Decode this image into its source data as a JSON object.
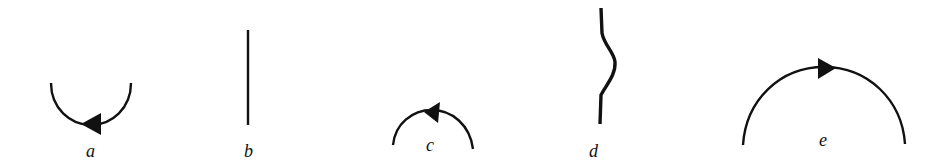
{
  "diagram": {
    "background": "#ffffff",
    "ink": "#111111",
    "items": [
      {
        "id": "a",
        "label": "a",
        "shape": "downward semicircle arc with arrow pointing left at bottom"
      },
      {
        "id": "b",
        "label": "b",
        "shape": "straight vertical line"
      },
      {
        "id": "c",
        "label": "c",
        "shape": "small upward arc with arrow pointing left at top"
      },
      {
        "id": "d",
        "label": "d",
        "shape": "wavy vertical line"
      },
      {
        "id": "e",
        "label": "e",
        "shape": "large upward arc with arrow pointing right at top"
      }
    ]
  }
}
